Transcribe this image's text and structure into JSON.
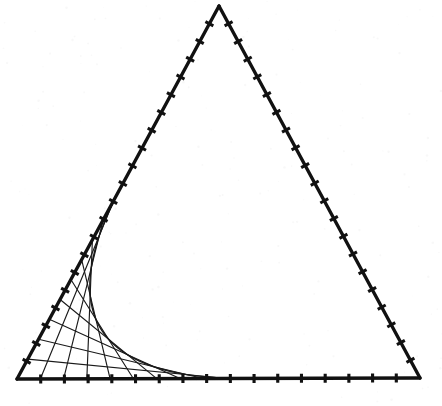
{
  "figure": {
    "kind": "line-envelope-geometric-construction",
    "background_color": "#ffffff",
    "ink_color": "#111111",
    "canvas": {
      "width": 442,
      "height": 406
    }
  },
  "chart_data": {
    "type": "scatter",
    "subtitle": "Envelope of straight lines joining graduated points on two sides",
    "xlabel": "",
    "ylabel": "",
    "grid": false,
    "legend": "none",
    "xlim": [
      0,
      442
    ],
    "ylim": [
      406,
      0
    ],
    "triangle": {
      "label": "outer-triangle",
      "apex": {
        "x": 219,
        "y": 6
      },
      "bottom_left": {
        "x": 17,
        "y": 379
      },
      "bottom_right": {
        "x": 420,
        "y": 378
      },
      "stroke_width": 3.4
    },
    "edges": [
      {
        "name": "left-edge",
        "from": "bottom_left",
        "to": "apex",
        "tick_count": 20,
        "tick_length": 9,
        "graduated": true
      },
      {
        "name": "right-edge",
        "from": "apex",
        "to": "bottom_right",
        "tick_count": 20,
        "tick_length": 9,
        "graduated": true
      },
      {
        "name": "bottom-edge",
        "from": "bottom_left",
        "to": "bottom_right",
        "tick_count": 16,
        "tick_length": 9,
        "graduated": true
      }
    ],
    "stitching": {
      "name": "curve-stitch-family",
      "vertex": "bottom_left",
      "side_a": "left-edge",
      "side_b": "bottom-edge",
      "chord_count": 9,
      "rule": "point k on left edge joins point (n+1-k) on bottom edge",
      "n": 9,
      "side_a_span_fraction": 0.48,
      "side_b_span_fraction": 0.52,
      "stroke_width": 1.15,
      "chords": [
        {
          "i": 1,
          "a_t": 0.0533,
          "b_t": 0.52
        },
        {
          "i": 2,
          "a_t": 0.1067,
          "b_t": 0.4622
        },
        {
          "i": 3,
          "a_t": 0.16,
          "b_t": 0.4044
        },
        {
          "i": 4,
          "a_t": 0.2133,
          "b_t": 0.3467
        },
        {
          "i": 5,
          "a_t": 0.2667,
          "b_t": 0.2889
        },
        {
          "i": 6,
          "a_t": 0.32,
          "b_t": 0.2311
        },
        {
          "i": 7,
          "a_t": 0.3733,
          "b_t": 0.1733
        },
        {
          "i": 8,
          "a_t": 0.4267,
          "b_t": 0.1156
        },
        {
          "i": 9,
          "a_t": 0.48,
          "b_t": 0.0578
        }
      ]
    },
    "envelope": {
      "name": "hyperbolic-envelope",
      "description": "Smooth curve tangent to every stitching chord, running from the left edge down to the bottom edge",
      "stroke_width": 1.4,
      "tangent_to": "all chords"
    }
  }
}
